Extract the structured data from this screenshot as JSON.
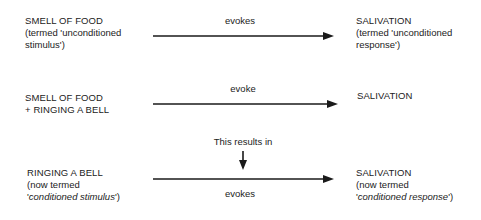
{
  "diagram": {
    "row1": {
      "stimulus": {
        "line1": "SMELL OF FOOD",
        "line2": "(termed 'unconditioned",
        "line3": "stimulus')"
      },
      "arrow_label": "evokes",
      "response": {
        "line1": "SALIVATION",
        "line2": "(termed 'unconditioned",
        "line3": "response')"
      }
    },
    "row2": {
      "stimulus": {
        "line1": "SMELL OF FOOD",
        "line2": "+ RINGING A BELL"
      },
      "arrow_label": "evoke",
      "response": {
        "line1": "SALIVATION"
      }
    },
    "transition": {
      "label": "This results in"
    },
    "row3": {
      "stimulus": {
        "line1": "RINGING A BELL",
        "line2": "(now termed",
        "line3_prefix": "'",
        "line3_italic": "conditioned stimulus",
        "line3_suffix": "')"
      },
      "arrow_label": "evokes",
      "response": {
        "line1": "SALIVATION",
        "line2": "(now termed",
        "line3_prefix": "'",
        "line3_italic": "conditioned response",
        "line3_suffix": "')"
      }
    },
    "colors": {
      "text": "#222222",
      "arrow": "#1a1a1a",
      "background": "#ffffff"
    }
  }
}
